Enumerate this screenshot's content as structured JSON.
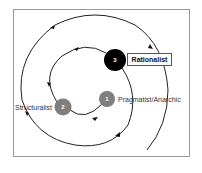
{
  "diagram": {
    "type": "spiral-process",
    "nodes": [
      {
        "number": "1",
        "label": "Pragmatist/Anarchic",
        "fill": "#7f7f7f"
      },
      {
        "number": "2",
        "label": "Structuralist",
        "fill": "#7f7f7f"
      },
      {
        "number": "3",
        "label": "Rationalist",
        "fill": "#000000"
      }
    ],
    "colors": {
      "line": "#222222",
      "frame": "#9a9a9a",
      "gray_node": "#7f7f7f",
      "black_node": "#000000"
    }
  }
}
